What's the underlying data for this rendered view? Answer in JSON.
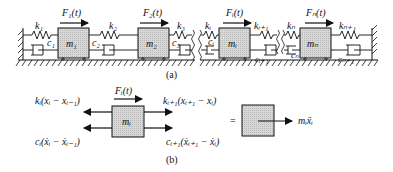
{
  "figure": {
    "part_a": {
      "caption": "(a)",
      "masses": [
        {
          "label": "m₁",
          "force": "F₁(t)"
        },
        {
          "label": "m₂",
          "force": "F₂(t)"
        },
        {
          "label": "mᵢ",
          "force": "Fᵢ(t)"
        },
        {
          "label": "mₙ",
          "force": "Fₙ(t)"
        }
      ],
      "springs": [
        "k₁",
        "k₂",
        "k₃",
        "kᵢ",
        "kᵢ₊₁",
        "kₙ",
        "kₙ₊₁"
      ],
      "dampers": [
        "c₁",
        "c₂",
        "c₃",
        "cᵢ",
        "cᵢ₊₁",
        "cₙ",
        "cₙ₊₁"
      ]
    },
    "part_b": {
      "caption": "(b)",
      "mass_label": "mᵢ",
      "force_label": "Fᵢ(t)",
      "left_spring_force": "kᵢ(xᵢ − xᵢ₋₁)",
      "left_damper_force": "cᵢ(ẋᵢ − ẋᵢ₋₁)",
      "right_spring_force": "kᵢ₊₁(xᵢ₊₁ − xᵢ)",
      "right_damper_force": "cᵢ₊₁(ẋᵢ₊₁ − ẋᵢ)",
      "equals": "=",
      "inertia_label": "mᵢẍᵢ"
    },
    "colors": {
      "mass_fill": "#d4d4d4",
      "ink": "#111111"
    }
  }
}
